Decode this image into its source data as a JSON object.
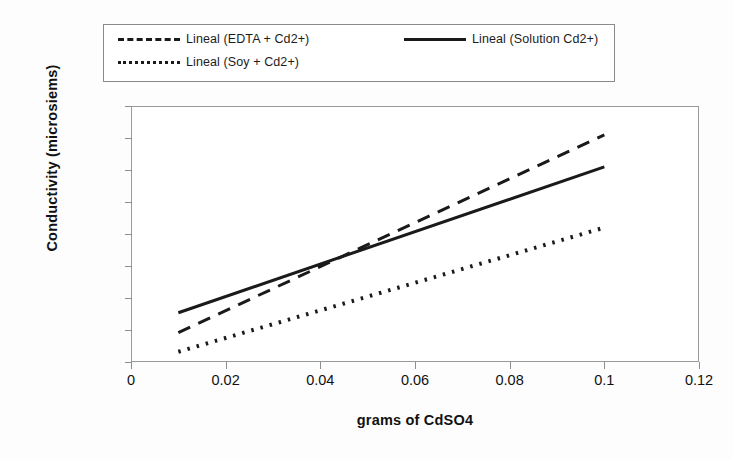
{
  "chart_data": {
    "type": "line",
    "title": "",
    "xlabel": "grams of CdSO4",
    "ylabel": "Conductivity (microsiems)",
    "xlim": [
      0,
      0.12
    ],
    "ylim": [
      0,
      4000
    ],
    "x_ticks": [
      "0",
      "0.02",
      "0.04",
      "0.06",
      "0.08",
      "0.1",
      "0.12"
    ],
    "x_tick_values": [
      0,
      0.02,
      0.04,
      0.06,
      0.08,
      0.1,
      0.12
    ],
    "y_ticks": [
      "0",
      "500",
      "1000",
      "1500",
      "2000",
      "2500",
      "3000",
      "3500",
      "4000"
    ],
    "y_tick_values": [
      0,
      500,
      1000,
      1500,
      2000,
      2500,
      3000,
      3500,
      4000
    ],
    "grid": false,
    "legend_position": "top",
    "series": [
      {
        "name": "Lineal (EDTA + Cd2+)",
        "style": "dashed",
        "color": "#1a1a1a",
        "x": [
          0.01,
          0.1
        ],
        "values": [
          460,
          3550
        ]
      },
      {
        "name": "Lineal (Solution Cd2+)",
        "style": "solid",
        "color": "#1a1a1a",
        "x": [
          0.01,
          0.1
        ],
        "values": [
          770,
          3050
        ]
      },
      {
        "name": "Lineal (Soy + Cd2+)",
        "style": "dotted",
        "color": "#1a1a1a",
        "x": [
          0.01,
          0.1
        ],
        "values": [
          160,
          2100
        ]
      }
    ]
  },
  "legend": {
    "entries": [
      {
        "label": "Lineal (EDTA + Cd2+)",
        "style": "dashed"
      },
      {
        "label": "Lineal (Solution Cd2+)",
        "style": "solid"
      },
      {
        "label": "Lineal (Soy + Cd2+)",
        "style": "dotted"
      }
    ]
  }
}
